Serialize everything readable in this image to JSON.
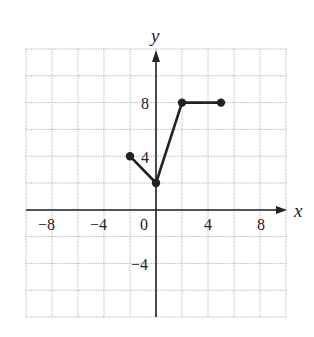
{
  "chart_data": {
    "type": "line",
    "title": "",
    "xlabel": "x",
    "ylabel": "y",
    "xlim": [
      -10,
      10
    ],
    "ylim": [
      -10,
      10
    ],
    "grid": true,
    "grid_step": 2,
    "x_ticks": [
      -8,
      -4,
      0,
      4,
      8
    ],
    "y_ticks": [
      8,
      4,
      -4
    ],
    "x_tick_labels": [
      "−8",
      "−4",
      "0",
      "4",
      "8"
    ],
    "y_tick_labels": [
      "8",
      "4",
      "−4"
    ],
    "series": [
      {
        "name": "piecewise",
        "points": [
          [
            -2,
            2
          ],
          [
            0,
            0
          ],
          [
            2,
            6
          ],
          [
            5,
            6
          ]
        ],
        "endpoints": "closed"
      }
    ]
  },
  "labels": {
    "x_axis": "x",
    "y_axis": "y",
    "tick_x_m8": "−8",
    "tick_x_m4": "−4",
    "tick_origin": "0",
    "tick_x_4": "4",
    "tick_x_8": "8",
    "tick_y_8": "8",
    "tick_y_4": "4",
    "tick_y_m4": "−4"
  }
}
